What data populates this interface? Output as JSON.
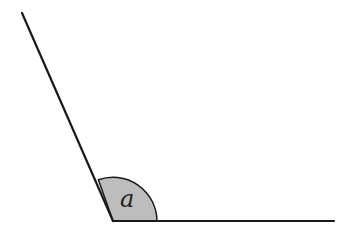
{
  "diagram": {
    "type": "angle",
    "angle_label": "a",
    "colors": {
      "line": "#1a1a1a",
      "arc_fill": "#bdbdbd",
      "background": "#ffffff"
    }
  }
}
